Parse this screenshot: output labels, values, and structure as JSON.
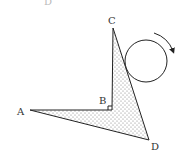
{
  "figure": {
    "top_cutoff_label": "D",
    "points": {
      "A": {
        "label": "A",
        "x": 30,
        "y": 110
      },
      "B": {
        "label": "B",
        "x": 112,
        "y": 110
      },
      "C": {
        "label": "C",
        "x": 113,
        "y": 28
      },
      "D": {
        "label": "D",
        "x": 149,
        "y": 140
      }
    },
    "right_angle_at": "B",
    "shaded_region": "dotted",
    "circle": {
      "cx": 146,
      "cy": 61,
      "r": 21
    },
    "rotation_arrow": "clockwise",
    "colors": {
      "stroke": "#222222",
      "dots": "#777777",
      "background": "#ffffff"
    }
  }
}
